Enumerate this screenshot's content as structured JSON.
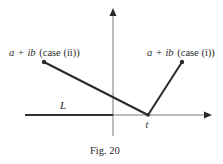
{
  "figure": {
    "caption": "Fig. 20",
    "labels": {
      "point_case_ii": {
        "var_a": "a",
        "plus": "+",
        "var_ib": "ib",
        "case": "(case (ii))"
      },
      "point_case_i": {
        "var_a": "a",
        "plus": "+",
        "var_ib": "ib",
        "case": "(case (i))"
      },
      "line_L": "L",
      "point_t": "t"
    },
    "colors": {
      "axis": "#555555",
      "segment": "#2a2a2a",
      "line_L": "#333333",
      "text": "#2a2a2a"
    }
  }
}
